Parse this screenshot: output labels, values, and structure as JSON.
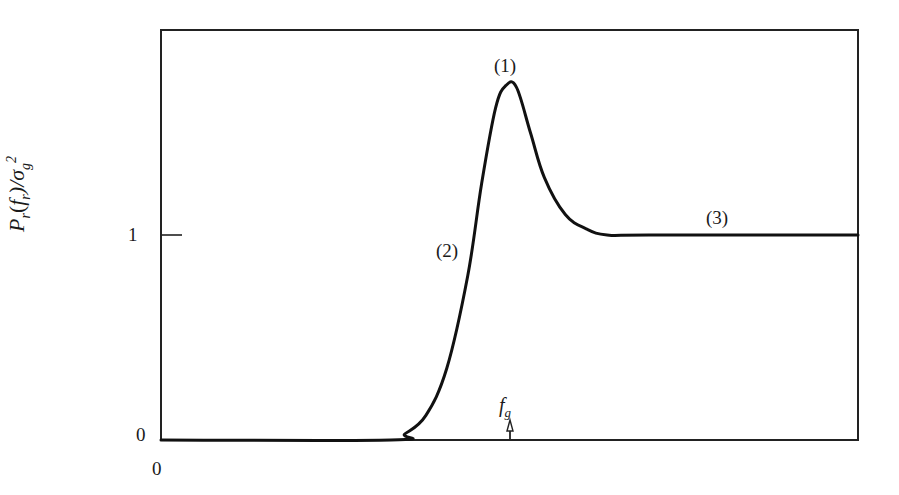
{
  "chart_data": {
    "type": "line",
    "title": "",
    "xlabel": "",
    "ylabel": "P_r(f_r)/σ_g²",
    "ylabel_parts": {
      "main": "P",
      "sub": "r",
      "arg_open": "(",
      "arg": "f",
      "arg_sub": "r",
      "arg_close": ")/σ",
      "sigma_sub": "g",
      "sigma_sup": "2"
    },
    "y_ticks": [
      {
        "value": 0,
        "label": "0"
      },
      {
        "value": 1,
        "label": "1"
      }
    ],
    "x_ticks": [
      {
        "value": 0,
        "label": "0"
      }
    ],
    "ylim": [
      0,
      2.0
    ],
    "xlim": [
      0,
      1.0
    ],
    "grid": false,
    "legend": null,
    "annotations": [
      {
        "label": "(1)",
        "meaning": "peak",
        "x": 0.5,
        "y": 1.78
      },
      {
        "label": "(2)",
        "meaning": "rising edge",
        "x": 0.42,
        "y": 0.92
      },
      {
        "label": "(3)",
        "meaning": "flat plateau",
        "x": 0.8,
        "y": 1.08
      },
      {
        "label": "f_g",
        "meaning": "marker on x-axis with up arrow",
        "x": 0.5,
        "y": 0.0
      }
    ],
    "series": [
      {
        "name": "P_r(f_r)/σ_g²",
        "x": [
          0.0,
          0.33,
          0.35,
          0.38,
          0.41,
          0.44,
          0.46,
          0.48,
          0.495,
          0.51,
          0.53,
          0.55,
          0.58,
          0.61,
          0.64,
          0.7,
          1.0
        ],
        "y": [
          0.0,
          0.0,
          0.03,
          0.12,
          0.35,
          0.8,
          1.25,
          1.62,
          1.73,
          1.72,
          1.5,
          1.28,
          1.1,
          1.03,
          1.0,
          1.0,
          1.0
        ]
      }
    ]
  },
  "labels": {
    "tick_y0": "0",
    "tick_y1": "1",
    "tick_x0": "0",
    "ann1": "(1)",
    "ann2": "(2)",
    "ann3": "(3)",
    "fg_main": "f",
    "fg_sub": "g"
  },
  "ylabel": {
    "P": "P",
    "r1": "r",
    "open": "(",
    "f": "f",
    "r2": "r",
    "close": ")/σ",
    "g": "g",
    "two": "2"
  }
}
